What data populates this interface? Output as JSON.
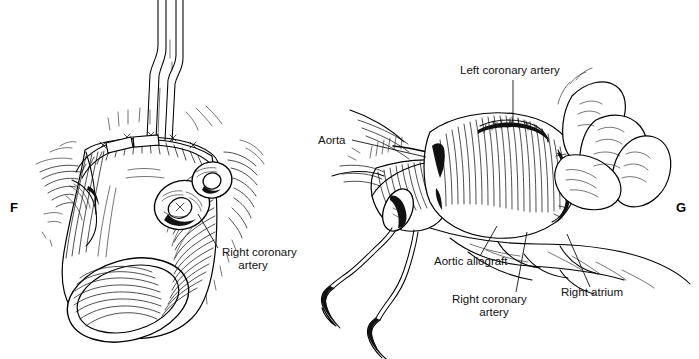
{
  "figure": {
    "background_color": "#ffffff",
    "ink_color": "#111111",
    "width": 699,
    "height": 359
  },
  "panels": [
    {
      "id": "F",
      "letter": "F",
      "letter_position": {
        "x": 10,
        "y": 212
      },
      "description": "Aortic root with completed proximal suture line, forceps retracting, coronary ostium buttons visible",
      "labels": [
        {
          "name": "right-coronary-artery",
          "lines": [
            "Right coronary",
            "artery"
          ],
          "text_position": {
            "x": 222,
            "y": 256
          },
          "leader": {
            "x1": 218,
            "y1": 248,
            "x2": 198,
            "y2": 214
          }
        }
      ]
    },
    {
      "id": "G",
      "letter": "G",
      "letter_position": {
        "x": 676,
        "y": 212
      },
      "description": "Completed aortic allograft in situ with left and right coronary anastomoses, right atrium and suture needles",
      "labels": [
        {
          "name": "aorta",
          "lines": [
            "Aorta"
          ],
          "text_position": {
            "x": 318,
            "y": 144
          },
          "leader": {
            "x1": 352,
            "y1": 140,
            "x2": 426,
            "y2": 157
          }
        },
        {
          "name": "left-coronary-artery",
          "lines": [
            "Left coronary artery"
          ],
          "text_position": {
            "x": 460,
            "y": 74
          },
          "leader": {
            "x1": 513,
            "y1": 80,
            "x2": 513,
            "y2": 122
          }
        },
        {
          "name": "aortic-allograft",
          "lines": [
            "Aortic allograft"
          ],
          "text_position": {
            "x": 434,
            "y": 265
          },
          "leader": {
            "x1": 480,
            "y1": 256,
            "x2": 497,
            "y2": 226
          }
        },
        {
          "name": "right-coronary-artery",
          "lines": [
            "Right coronary",
            "artery"
          ],
          "text_position": {
            "x": 452,
            "y": 303
          },
          "leader": {
            "x1": 516,
            "y1": 292,
            "x2": 527,
            "y2": 232
          }
        },
        {
          "name": "right-atrium",
          "lines": [
            "Right atrium"
          ],
          "text_position": {
            "x": 561,
            "y": 296
          },
          "leader": {
            "x1": 590,
            "y1": 287,
            "x2": 567,
            "y2": 234
          }
        }
      ]
    }
  ]
}
